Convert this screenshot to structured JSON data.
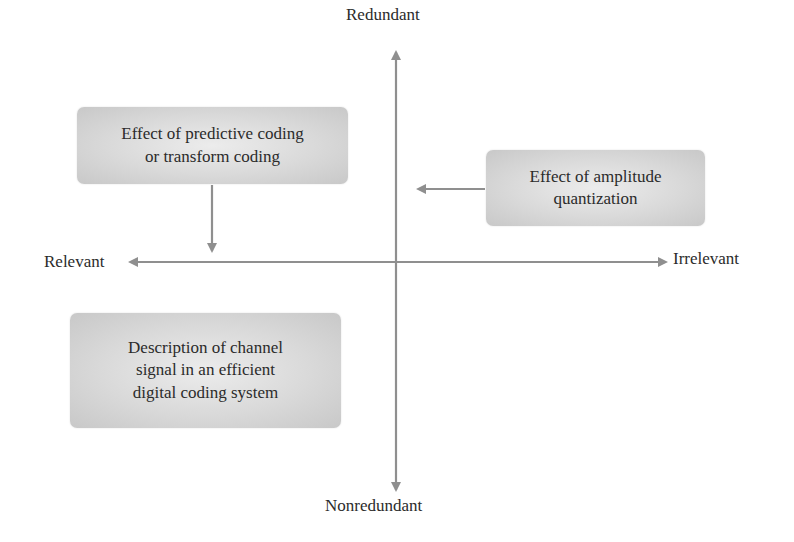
{
  "diagram": {
    "type": "quadrant-diagram",
    "axes": {
      "vertical": {
        "top_label": "Redundant",
        "bottom_label": "Nonredundant"
      },
      "horizontal": {
        "left_label": "Relevant",
        "right_label": "Irrelevant"
      }
    },
    "boxes": [
      {
        "id": "predictive-coding",
        "text": "Effect of predictive coding\nor transform coding",
        "arrow_direction": "down"
      },
      {
        "id": "amplitude-quantization",
        "text": "Effect of amplitude\nquantization",
        "arrow_direction": "left"
      },
      {
        "id": "channel-signal",
        "text": "Description of channel\nsignal in an efficient\ndigital coding system",
        "arrow_direction": "none"
      }
    ],
    "colors": {
      "arrow": "#8f8f8f",
      "box_fill": "#d9d9d9",
      "text": "#2b2b2b",
      "background": "#ffffff"
    }
  }
}
